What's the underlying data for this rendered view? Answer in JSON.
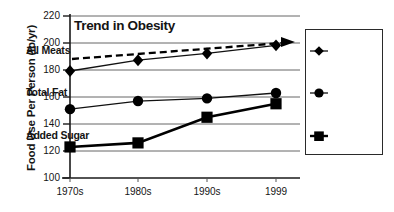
{
  "chart_data": {
    "type": "line",
    "title": "Trend in Obesity",
    "xlabel": "",
    "ylabel": "Food Use Per Person (lb/yr)",
    "categories": [
      "1970s",
      "1980s",
      "1990s",
      "1999"
    ],
    "ylim": [
      100,
      220
    ],
    "yticks": [
      100,
      120,
      140,
      160,
      180,
      200,
      220
    ],
    "ytick_labels": [
      "100",
      "120",
      "140",
      "160",
      "180",
      "200",
      "220"
    ],
    "grid": true,
    "legend_position": "right",
    "series": [
      {
        "name": "All Meats",
        "marker": "diamond",
        "values": [
          177,
          185,
          190,
          196
        ],
        "color": "#000000"
      },
      {
        "name": "Total Fat",
        "marker": "circle",
        "values": [
          151,
          157,
          159,
          163
        ],
        "color": "#000000"
      },
      {
        "name": "Added Sugar",
        "marker": "square",
        "values": [
          123,
          126,
          145,
          155
        ],
        "color": "#000000"
      }
    ],
    "annotations": [
      {
        "name": "trend-arrow",
        "style": "dashed-line-with-arrowhead",
        "from": [
          0,
          188
        ],
        "to": [
          3,
          200
        ],
        "color": "#000000"
      }
    ]
  },
  "title": {
    "text": "Trend in Obesity"
  },
  "axes": {
    "y_title": "Food Use Per Person (lb/yr)",
    "y_ticks": [
      {
        "label": "220"
      },
      {
        "label": "200"
      },
      {
        "label": "180"
      },
      {
        "label": "160"
      },
      {
        "label": "140"
      },
      {
        "label": "120"
      },
      {
        "label": "100"
      }
    ],
    "x_ticks": [
      {
        "label": "1970s"
      },
      {
        "label": "1980s"
      },
      {
        "label": "1990s"
      },
      {
        "label": "1999"
      }
    ]
  },
  "legend": {
    "items": [
      {
        "label": "All Meats",
        "marker": "diamond"
      },
      {
        "label": "Total Fat",
        "marker": "circle"
      },
      {
        "label": "Added Sugar",
        "marker": "square"
      }
    ]
  }
}
